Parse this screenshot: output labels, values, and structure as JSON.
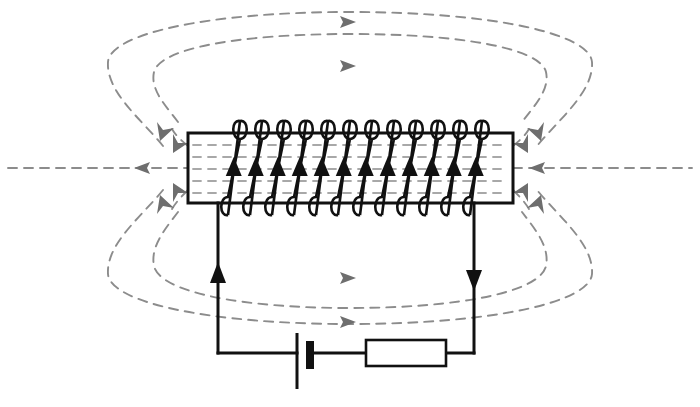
{
  "figure": {
    "background_color": "#ffffff",
    "width": 700,
    "height": 407
  },
  "colors": {
    "wire": "#111111",
    "coil": "#111111",
    "field_line": "#8c8c8c",
    "field_arrow": "#6e6e6e",
    "core_hatch": "#a8a8a8",
    "solenoid_border": "#111111"
  },
  "solenoid": {
    "label": "solenoid",
    "box": {
      "x": 188,
      "y": 133,
      "width": 325,
      "height": 70
    },
    "turns": 12,
    "turn_arrow_direction": "up",
    "first_turn_x": 228,
    "turn_spacing": 22,
    "interior_hatch_rows": 5,
    "current_arrow_label": "current direction in windings"
  },
  "circuit": {
    "left_wire": {
      "label": "left lead wire",
      "x": 218,
      "top_y": 203,
      "bottom_y": 353,
      "arrow_direction": "up",
      "arrow_y": 277
    },
    "right_wire": {
      "label": "right lead wire",
      "x": 474,
      "top_y": 203,
      "bottom_y": 353,
      "arrow_direction": "down",
      "arrow_y": 277
    },
    "bottom_wire_y": 353,
    "battery": {
      "label": "battery",
      "long_plate_x": 297,
      "long_plate_top": 333,
      "long_plate_bottom": 388,
      "short_plate_x": 310,
      "short_plate_top": 341,
      "short_plate_bottom": 368,
      "polarity_long": "positive",
      "polarity_short": "negative"
    },
    "resistor": {
      "label": "resistor",
      "x": 366,
      "y": 340,
      "width": 80,
      "height": 26
    }
  },
  "field_lines": {
    "description": "concentric dashed magnetic field loops surrounding the solenoid",
    "dash_pattern": "9 7",
    "axis_line": {
      "label": "central axis field line",
      "y": 168,
      "left_x": 8,
      "right_x": 692,
      "arrow_left_x": 150,
      "arrow_right_x": 545,
      "arrow_direction": "left"
    },
    "top_loops": [
      {
        "name": "outer-top-loop",
        "arrow_x": 348,
        "arrow_y": 21,
        "arrow_direction": "right"
      },
      {
        "name": "inner-top-loop",
        "arrow_x": 348,
        "arrow_y": 65,
        "arrow_direction": "right"
      }
    ],
    "bottom_loops": [
      {
        "name": "inner-bottom-loop",
        "arrow_x": 348,
        "arrow_y": 277,
        "arrow_direction": "right"
      },
      {
        "name": "outer-bottom-loop",
        "arrow_x": 348,
        "arrow_y": 321,
        "arrow_direction": "right"
      }
    ],
    "end_arrows_left": [
      {
        "name": "left-upper-outer",
        "x": 163,
        "y": 145,
        "direction": "down-left"
      },
      {
        "name": "left-upper-inner",
        "x": 177,
        "y": 121,
        "direction": "down-left"
      },
      {
        "name": "left-lower-inner",
        "x": 177,
        "y": 192,
        "direction": "up-left"
      },
      {
        "name": "left-lower-outer",
        "x": 163,
        "y": 213,
        "direction": "up-left"
      }
    ],
    "end_arrows_right": [
      {
        "name": "right-upper-outer",
        "x": 540,
        "y": 145,
        "direction": "down-left"
      },
      {
        "name": "right-upper-inner",
        "x": 535,
        "y": 121,
        "direction": "down-left"
      },
      {
        "name": "right-lower-inner",
        "x": 535,
        "y": 192,
        "direction": "up-left"
      },
      {
        "name": "right-lower-outer",
        "x": 540,
        "y": 213,
        "direction": "up-left"
      }
    ]
  }
}
